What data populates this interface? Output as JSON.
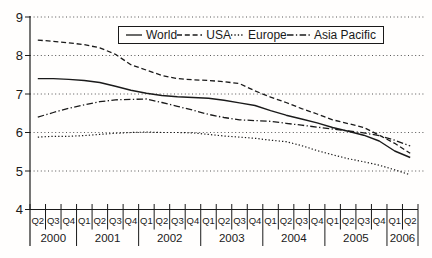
{
  "colors": {
    "background": "#fffefd",
    "axis": "#1a1a1a",
    "gridline": "#555555",
    "series_color": "#1a1a1a",
    "text": "#1a1a1a"
  },
  "chart_data": {
    "type": "line",
    "title": "",
    "xlabel": "",
    "ylabel": "",
    "ylim": [
      4,
      9
    ],
    "yticks": [
      4,
      5,
      6,
      7,
      8,
      9
    ],
    "grid": "horizontal dotted gridlines at each integer",
    "legend_position": "top-center, boxed, horizontal",
    "x_quarter_labels": [
      "Q2",
      "Q3",
      "Q4",
      "Q1",
      "Q2",
      "Q3",
      "Q4",
      "Q1",
      "Q2",
      "Q3",
      "Q4",
      "Q1",
      "Q2",
      "Q3",
      "Q4",
      "Q1",
      "Q2",
      "Q3",
      "Q4",
      "Q1",
      "Q2",
      "Q3",
      "Q4",
      "Q1",
      "Q2"
    ],
    "x_year_groups": [
      {
        "label": "2000",
        "quarters": 3
      },
      {
        "label": "2001",
        "quarters": 4
      },
      {
        "label": "2002",
        "quarters": 4
      },
      {
        "label": "2003",
        "quarters": 4
      },
      {
        "label": "2004",
        "quarters": 4
      },
      {
        "label": "2005",
        "quarters": 4
      },
      {
        "label": "2006",
        "quarters": 2
      }
    ],
    "series": [
      {
        "name": "World",
        "line_style": "solid",
        "values": [
          7.4,
          7.4,
          7.38,
          7.35,
          7.3,
          7.2,
          7.1,
          7.02,
          6.96,
          6.93,
          6.91,
          6.89,
          6.84,
          6.77,
          6.7,
          6.57,
          6.45,
          6.35,
          6.25,
          6.13,
          6.03,
          5.93,
          5.78,
          5.52,
          5.35
        ]
      },
      {
        "name": "USA",
        "line_style": "dashed",
        "values": [
          8.4,
          8.37,
          8.33,
          8.28,
          8.2,
          8.03,
          7.76,
          7.62,
          7.48,
          7.4,
          7.37,
          7.35,
          7.32,
          7.27,
          7.08,
          6.92,
          6.78,
          6.62,
          6.48,
          6.33,
          6.23,
          6.13,
          5.93,
          5.72,
          5.46
        ]
      },
      {
        "name": "Europe",
        "line_style": "dotted",
        "values": [
          5.88,
          5.9,
          5.9,
          5.92,
          5.95,
          5.98,
          6.0,
          6.01,
          6.0,
          6.0,
          5.99,
          5.95,
          5.91,
          5.88,
          5.85,
          5.8,
          5.76,
          5.66,
          5.53,
          5.42,
          5.32,
          5.24,
          5.15,
          5.03,
          4.9
        ]
      },
      {
        "name": "Asia Pacific",
        "line_style": "dashdot",
        "values": [
          6.4,
          6.52,
          6.63,
          6.72,
          6.8,
          6.85,
          6.86,
          6.87,
          6.78,
          6.68,
          6.58,
          6.47,
          6.39,
          6.33,
          6.31,
          6.29,
          6.24,
          6.19,
          6.14,
          6.09,
          6.04,
          5.99,
          5.92,
          5.8,
          5.65
        ]
      }
    ]
  }
}
